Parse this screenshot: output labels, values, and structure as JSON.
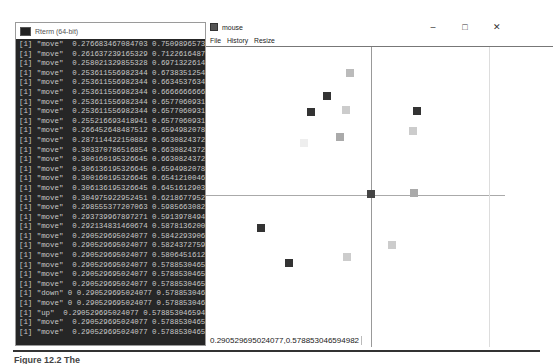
{
  "rterm": {
    "title": "Rterm (64-bit)",
    "lines": [
      "[1] \"move\"  0.276683467084703 0.750989657347671",
      "[1] \"move\"  0.261637239165329 0.712261648745520",
      "[1] \"move\"  0.258021329855328 0.697132261467450",
      "[1] \"move\"  0.253611556982344 0.673835125448030",
      "[1] \"move\"  0.253611556982344 0.663453763410620",
      "[1] \"move\"  0.253611556982344 0.666666666666660",
      "[1] \"move\"  0.253611556982344 0.657706093189960",
      "[1] \"move\"  0.253611556982344 0.657706093189960",
      "[1] \"move\"  0.255216693418941 0.657706093189960",
      "[1] \"move\"  0.266452648487512 0.659498207885305",
      "[1] \"move\"  0.287114422150882 0.663082437275900",
      "[1] \"move\"  0.303370786516854 0.663082437275900",
      "[1] \"move\"  0.300160195326645 0.663082437275900",
      "[1] \"move\"  0.306136195326645 0.659498207885300",
      "[1] \"move\"  0.300160195326645 0.654121004679000",
      "[1] \"move\"  0.306136195326645 0.645161290322580",
      "[1] \"move\"  0.304975922952451 0.621867795231150",
      "[1] \"move\"  0.298555377207063 0.598566308243720",
      "[1] \"move\"  0.293739967897271 0.591397849462360",
      "[1] \"move\"  0.292134831460674 0.587813620071680",
      "[1] \"move\"  0.290529695024077 0.584229390681000",
      "[1] \"move\"  0.290529695024077 0.582437275985660",
      "[1] \"move\"  0.290529695024077 0.580645161290320",
      "[1] \"move\"  0.290529695024077 0.578853046594980",
      "[1] \"move\"  0.290529695024077 0.578853046594980",
      "[1] \"move\"  0.290529695024077 0.578853046594980",
      "[1] \"down\" 0 0.290529695024077 0.578853046594980",
      "[1] \"move\" 0 0.290529695024077 0.578853046594980",
      "[1] \"up\"  0.290529695024077 0.578853046594982",
      "[1] \"move\"  0.290529695024077 0.578853046594980",
      "[1] \"move\"  0.290529695024077 0.578853046594980"
    ]
  },
  "mouse_window": {
    "title": "mouse",
    "controls": {
      "minimize": "–",
      "maximize": "□",
      "close": "✕"
    },
    "menu": [
      "File",
      "History",
      "Resize"
    ],
    "status_text": "0.290529695024077,0.578853046594982",
    "points": [
      {
        "x": 140,
        "y": 22,
        "color": "#bbbbbb"
      },
      {
        "x": 117,
        "y": 45,
        "color": "#333333"
      },
      {
        "x": 101,
        "y": 61,
        "color": "#333333"
      },
      {
        "x": 136,
        "y": 59,
        "color": "#cccccc"
      },
      {
        "x": 130,
        "y": 86,
        "color": "#aaaaaa"
      },
      {
        "x": 94,
        "y": 92,
        "color": "#eeeeee"
      },
      {
        "x": 207,
        "y": 60,
        "color": "#333333"
      },
      {
        "x": 203,
        "y": 80,
        "color": "#cccccc"
      },
      {
        "x": 161,
        "y": 143,
        "color": "#444444"
      },
      {
        "x": 204,
        "y": 142,
        "color": "#aaaaaa"
      },
      {
        "x": 51,
        "y": 177,
        "color": "#333333"
      },
      {
        "x": 79,
        "y": 212,
        "color": "#333333"
      },
      {
        "x": 137,
        "y": 206,
        "color": "#cccccc"
      },
      {
        "x": 182,
        "y": 194,
        "color": "#cccccc"
      }
    ]
  },
  "caption": "Figure 12.2   The"
}
